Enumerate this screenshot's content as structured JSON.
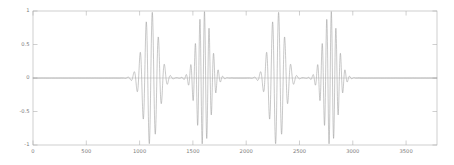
{
  "chart_data": {
    "type": "line",
    "title": "",
    "subtitle": "",
    "xlabel": "",
    "ylabel": "",
    "xlim": [
      0,
      3790
    ],
    "ylim": [
      -1,
      1
    ],
    "grid": false,
    "legend": null,
    "background_color": "#ffffff",
    "line_color": "#9a9a9a",
    "axis_color": "#b0b0b0",
    "tick_label_color": "#7a7a7a",
    "xticks": [
      0,
      500,
      1000,
      1500,
      2000,
      2500,
      3000,
      3500
    ],
    "xtick_labels": [
      "0",
      "500",
      "1000",
      "1500",
      "2000",
      "2500",
      "3000",
      "3500"
    ],
    "yticks": [
      -1,
      -0.5,
      0,
      0.5,
      1
    ],
    "ytick_labels": [
      "-1",
      "-0.5",
      "0",
      "0.5",
      "1"
    ],
    "series": [
      {
        "name": "waveform",
        "color": "#9a9a9a",
        "packets": [
          {
            "center": 1105,
            "peak_amplitude": 1.0,
            "half_width": 150,
            "period": 57,
            "phase": 0.0
          },
          {
            "center": 1600,
            "peak_amplitude": 1.0,
            "half_width": 140,
            "period": 43,
            "phase": 0.3
          },
          {
            "center": 2290,
            "peak_amplitude": 1.0,
            "half_width": 150,
            "period": 57,
            "phase": 0.0
          },
          {
            "center": 2790,
            "peak_amplitude": 1.0,
            "half_width": 140,
            "period": 43,
            "phase": 0.3
          }
        ]
      }
    ]
  },
  "axes": {
    "frame": {
      "left": 33,
      "top": 11,
      "right": 437,
      "bottom": 145
    }
  }
}
